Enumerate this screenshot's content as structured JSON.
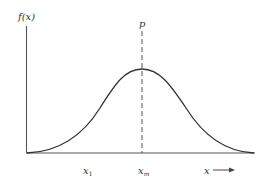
{
  "diagram": {
    "y_axis_label": "f(x)",
    "peak_label": "p",
    "x_labels": {
      "x1": "x",
      "x1_sub": "1",
      "xm": "x",
      "xm_sub": "m",
      "x_axis": "x"
    },
    "colors": {
      "axis": "#555555",
      "curve": "#333333",
      "dashed": "#555555",
      "text": "#333333"
    }
  }
}
